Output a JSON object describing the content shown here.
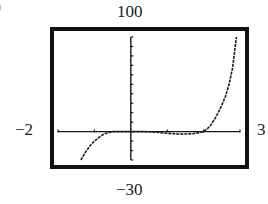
{
  "figure": {
    "part_label_fragment": ")",
    "window_labels": {
      "ymax": "100",
      "ymin": "−30",
      "xmin": "−2",
      "xmax": "3"
    },
    "colors": {
      "frame": "#111111",
      "axis": "#1a1a1a",
      "curve": "#1a1a1a",
      "background": "#ffffff"
    }
  },
  "chart_data": {
    "type": "line",
    "title": "",
    "xlabel": "",
    "ylabel": "",
    "xlim": [
      -2,
      3
    ],
    "ylim": [
      -30,
      100
    ],
    "xscl": 1,
    "yscl": 10,
    "grid": false,
    "legend": null,
    "tick_labels": {
      "xmin": "−2",
      "xmax": "3",
      "ymin": "−30",
      "ymax": "100"
    },
    "series": [
      {
        "name": "f(x)",
        "style": "calculator-pixel",
        "x": [
          -1.37,
          -1.25,
          -1.1,
          -1.0,
          -0.9,
          -0.8,
          -0.7,
          -0.6,
          -0.5,
          -0.3,
          0.0,
          0.3,
          0.6,
          0.8,
          1.0,
          1.2,
          1.45,
          1.7,
          1.9,
          2.0,
          2.1,
          2.2,
          2.3,
          2.4,
          2.5,
          2.6,
          2.7,
          2.8,
          2.9
        ],
        "y": [
          -30,
          -22,
          -14,
          -10,
          -7,
          -4,
          -2,
          -1,
          0,
          0,
          0,
          0,
          -0.3,
          -1,
          -1.8,
          -2.3,
          -2.6,
          -2.2,
          -1,
          0,
          3,
          7,
          13,
          20,
          28,
          37,
          50,
          68,
          100
        ]
      }
    ]
  }
}
